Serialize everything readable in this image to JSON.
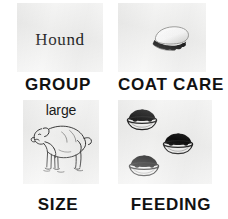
{
  "infographic": {
    "description": "Dog breed attribute icon grid",
    "background_color": "#ffffff",
    "panel_color": "#f2f2f1",
    "ink_color": "#121212",
    "cells": [
      {
        "id": "group",
        "caption": "GROUP",
        "value": "Hound",
        "icon": "text-label"
      },
      {
        "id": "coat-care",
        "caption": "COAT CARE",
        "value": "",
        "icon": "grooming-brush-icon"
      },
      {
        "id": "size",
        "caption": "SIZE",
        "value": "large",
        "icon": "large-dog-illustration"
      },
      {
        "id": "feeding",
        "caption": "FEEDING",
        "value": "",
        "icon": "three-food-bowls-icon"
      }
    ]
  }
}
